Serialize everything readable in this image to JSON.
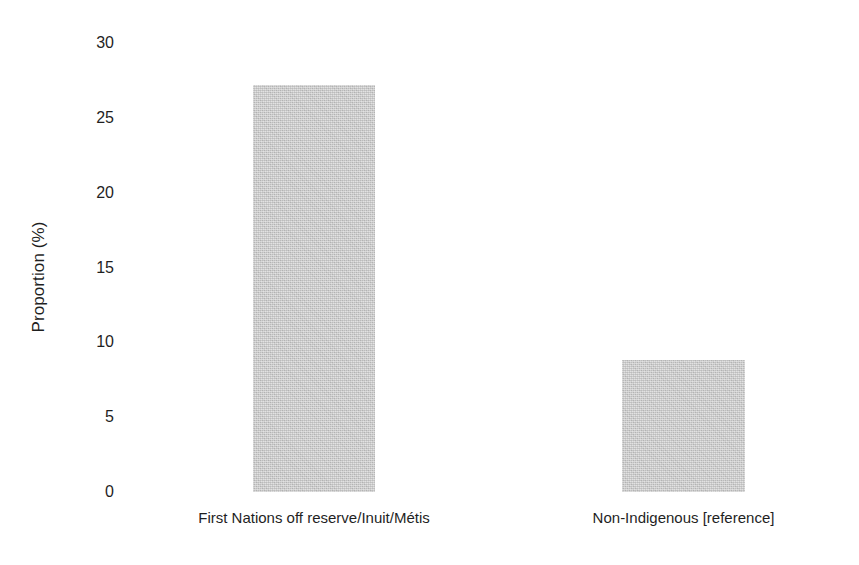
{
  "chart_data": {
    "type": "bar",
    "title": "",
    "subtitle": "",
    "xlabel": "",
    "ylabel": "Proportion (%)",
    "categories": [
      "First Nations off reserve/Inuit/Métis",
      "Non-Indigenous [reference]"
    ],
    "values": [
      27.2,
      8.8
    ],
    "ylim": [
      0,
      30
    ],
    "yticks": [
      0,
      5,
      10,
      15,
      20,
      25,
      30
    ],
    "ytick_labels": [
      "0",
      "5",
      "10",
      "15",
      "20",
      "25",
      "30"
    ],
    "grid": false,
    "legend": false,
    "legend_position": "none",
    "bar_color": "#c2c2c2",
    "background_color": "#ffffff",
    "axis_line": false
  },
  "axis": {
    "y_title": "Proportion (%)",
    "ticks": [
      {
        "label": "30",
        "value": 30
      },
      {
        "label": "25",
        "value": 25
      },
      {
        "label": "20",
        "value": 20
      },
      {
        "label": "15",
        "value": 15
      },
      {
        "label": "10",
        "value": 10
      },
      {
        "label": "5",
        "value": 5
      },
      {
        "label": "0",
        "value": 0
      }
    ]
  },
  "bars": [
    {
      "label": "First Nations off reserve/Inuit/Métis",
      "value": 27.2
    },
    {
      "label": "Non-Indigenous [reference]",
      "value": 8.8
    }
  ]
}
